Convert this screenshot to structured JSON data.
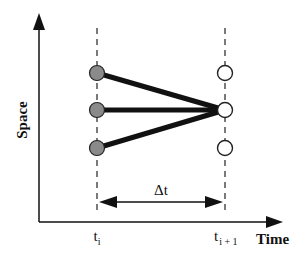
{
  "diagram": {
    "type": "space-time interpolation schematic",
    "axes": {
      "x_label": "Time",
      "y_label": "Space"
    },
    "time_marks": [
      {
        "id": "t_i",
        "base": "t",
        "subscript": "i"
      },
      {
        "id": "t_i_plus_1",
        "base": "t",
        "subscript": "i + 1"
      }
    ],
    "interval_label": "Δt",
    "nodes_at_t_i": [
      {
        "position": "top",
        "fill": "gray"
      },
      {
        "position": "middle",
        "fill": "gray"
      },
      {
        "position": "bottom",
        "fill": "gray"
      }
    ],
    "nodes_at_t_i_plus_1": [
      {
        "position": "top",
        "fill": "white"
      },
      {
        "position": "middle",
        "fill": "white",
        "target": true
      },
      {
        "position": "bottom",
        "fill": "white"
      }
    ],
    "connections": [
      {
        "from": "t_i.top",
        "to": "t_i_plus_1.middle"
      },
      {
        "from": "t_i.middle",
        "to": "t_i_plus_1.middle"
      },
      {
        "from": "t_i.bottom",
        "to": "t_i_plus_1.middle"
      }
    ],
    "colors": {
      "filled_node": "#8a8a8a",
      "open_node": "#ffffff",
      "stroke": "#111111",
      "dashed_line": "#333333"
    }
  }
}
